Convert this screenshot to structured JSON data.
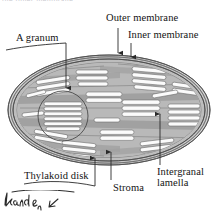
{
  "figure": {
    "top_cut_text": "the inner membrane",
    "labels": {
      "outer_membrane": "Outer membrane",
      "inner_membrane": "Inner membrane",
      "a_granum": "A granum",
      "thylakoid_disk": "Thylakoid disk",
      "stroma": "Stroma",
      "intergranal_lamella_line1": "Intergranal",
      "intergranal_lamella_line2": "lamella"
    },
    "annotation": {
      "handwriting": "kand & n",
      "type": "handwritten-pen-mark"
    },
    "colors": {
      "background": "#ffffff",
      "stroma_fill": "#b5b5b5",
      "stroma_fill_light": "#c4c4c4",
      "membrane_band": "#9a9a9a",
      "thylakoid_fill": "#fbfbfb",
      "thylakoid_stroke": "#6d6d6d",
      "outline": "#4a4a4a",
      "text": "#141414",
      "leader_line": "#3a3a3a"
    },
    "icons": {
      "arrow_down": "arrow-down-icon",
      "arrow_up": "arrow-up-icon",
      "granum_circle": "circle-highlight-icon"
    }
  }
}
